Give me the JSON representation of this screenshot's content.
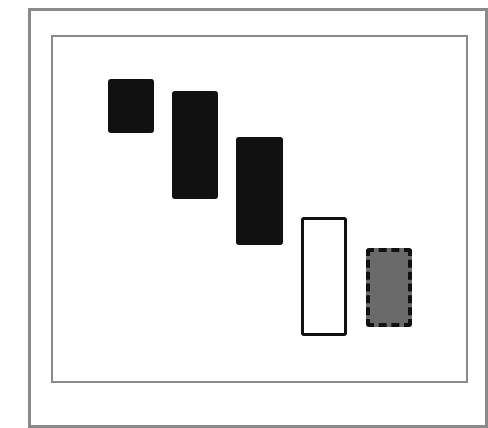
{
  "diagram": {
    "type": "candlestick-pattern",
    "frame": {
      "outer_border_color": "#8a8a8a",
      "inner_border_color": "#8a8a8a"
    },
    "candles": [
      {
        "id": "candle-1",
        "style": "filled-black",
        "fill": "#111111",
        "border": "#111111",
        "border_style": "solid",
        "x": 108,
        "y": 79,
        "w": 46,
        "h": 54
      },
      {
        "id": "candle-2",
        "style": "filled-black",
        "fill": "#111111",
        "border": "#111111",
        "border_style": "solid",
        "x": 172,
        "y": 91,
        "w": 46,
        "h": 108
      },
      {
        "id": "candle-3",
        "style": "filled-black",
        "fill": "#111111",
        "border": "#111111",
        "border_style": "solid",
        "x": 236,
        "y": 137,
        "w": 47,
        "h": 108
      },
      {
        "id": "candle-4",
        "style": "hollow-white",
        "fill": "#ffffff",
        "border": "#111111",
        "border_style": "solid",
        "x": 301,
        "y": 217,
        "w": 46,
        "h": 119
      },
      {
        "id": "candle-5",
        "style": "gray-dashed",
        "fill": "#6a6a6a",
        "border": "#111111",
        "border_style": "dashed",
        "x": 366,
        "y": 248,
        "w": 46,
        "h": 79
      }
    ]
  }
}
